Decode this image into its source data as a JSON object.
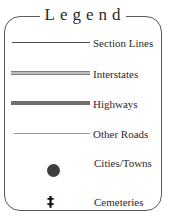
{
  "legend": {
    "title": "Legend",
    "title_spaced": "Legend",
    "items": [
      {
        "label": "Section Lines",
        "symbol": "thin-dark-line",
        "color": "#4a4a4a"
      },
      {
        "label": "Interstates",
        "symbol": "double-gray-line",
        "color": "#7d7d7d"
      },
      {
        "label": "Highways",
        "symbol": "thick-gray-line",
        "color": "#6f6f6f"
      },
      {
        "label": "Other Roads",
        "symbol": "thin-light-line",
        "color": "#9a9a9a"
      },
      {
        "label": "Cities/Towns",
        "symbol": "filled-circle",
        "color": "#3d3d3d"
      },
      {
        "label": "Cemeteries",
        "symbol": "cross-icon",
        "glyph": "‡",
        "color": "#111111"
      }
    ]
  }
}
